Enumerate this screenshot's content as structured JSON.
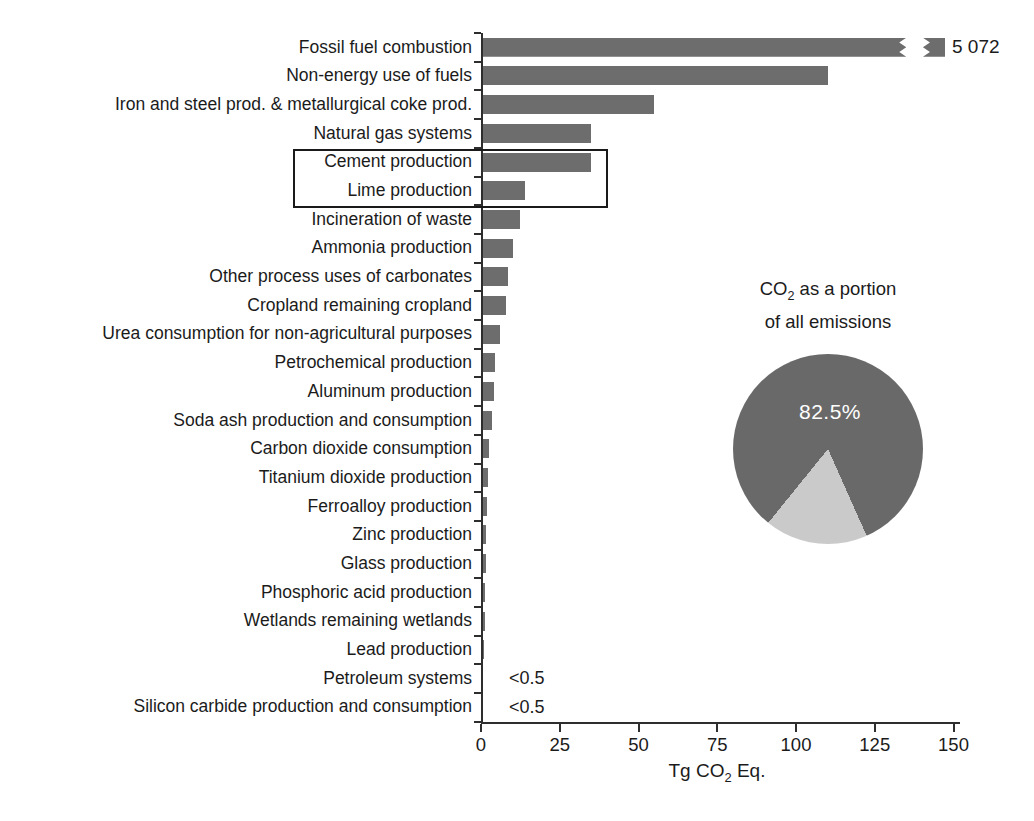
{
  "colors": {
    "bar": "#6d6d6d",
    "pie_dark": "#696969",
    "pie_light": "#cacaca",
    "text": "#1b1b1b",
    "axis": "#2e2e2e",
    "box_border": "#1a1a1a",
    "pie_label_text": "#ffffff",
    "background": "#ffffff"
  },
  "chart_data": [
    {
      "type": "bar",
      "orientation": "horizontal",
      "title": "",
      "xlabel": "Tg CO2 Eq.",
      "xlabel_parts": {
        "pre": "Tg CO",
        "sub": "2",
        "post": " Eq."
      },
      "x_ticks": [
        0,
        25,
        50,
        75,
        100,
        125,
        150
      ],
      "xlim": [
        0,
        152
      ],
      "grid": false,
      "legend": "none",
      "categories": [
        "Fossil fuel combustion",
        "Non-energy use of fuels",
        "Iron and steel prod. & metallurgical coke prod.",
        "Natural gas systems",
        "Cement production",
        "Lime production",
        "Incineration of waste",
        "Ammonia production",
        "Other process uses of carbonates",
        "Cropland remaining cropland",
        "Urea consumption for non-agricultural purposes",
        "Petrochemical production",
        "Aluminum production",
        "Soda ash production and consumption",
        "Carbon dioxide consumption",
        "Titanium dioxide production",
        "Ferroalloy production",
        "Zinc production",
        "Glass production",
        "Phosphoric acid production",
        "Wetlands remaining wetlands",
        "Lead production",
        "Petroleum systems",
        "Silicon carbide production and consumption"
      ],
      "values": [
        5072,
        110,
        55,
        35,
        35,
        14,
        12.5,
        10,
        8.5,
        8,
        6,
        4.5,
        4,
        3.5,
        2.5,
        2.3,
        2,
        1.7,
        1.5,
        1.4,
        1.2,
        0.8,
        0.4,
        0.4
      ],
      "value_labels": {
        "0": "5 072",
        "22": "<0.5",
        "23": "<0.5"
      },
      "truncated_bar": {
        "index": 0,
        "break_at_units": 135,
        "resume_at_units": 140.3,
        "end_at_units": 147.3
      },
      "highlighted_categories": [
        "Cement production",
        "Lime production"
      ]
    },
    {
      "type": "pie",
      "title": "CO2 as a portion of all emissions",
      "title_parts": {
        "l1_pre": "CO",
        "l1_sub": "2",
        "l1_post": " as a portion",
        "l2": "of all emissions"
      },
      "slices": [
        {
          "label": "CO2",
          "value": 82.5
        },
        {
          "label": "All other emissions",
          "value": 17.5
        }
      ],
      "data_label": "82.5%",
      "light_slice_css_angles": {
        "from": 156,
        "to": 219
      },
      "position": "inset lower right"
    }
  ]
}
